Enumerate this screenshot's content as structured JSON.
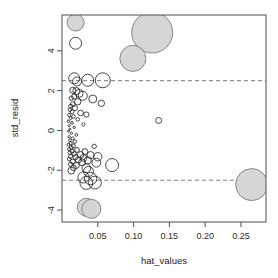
{
  "chart_data": {
    "type": "scatter",
    "title": "",
    "subtitle": "",
    "xlabel": "hat_values",
    "ylabel": "std_resid",
    "xlim": [
      0.0,
      0.285
    ],
    "ylim": [
      -4.6,
      5.8
    ],
    "xticks": [
      0.05,
      0.1,
      0.15,
      0.2,
      0.25
    ],
    "xtick_labels": [
      "0.05",
      "0.10",
      "0.15",
      "0.20",
      "0.25"
    ],
    "yticks": [
      4,
      2,
      0,
      -2,
      -4
    ],
    "ytick_labels": [
      "4",
      "2",
      "0",
      "-2",
      "-4"
    ],
    "grid": false,
    "legend": null,
    "annotations": [
      {
        "kind": "hline",
        "y": 2.5,
        "style": "dashed",
        "label": "+2.5 std_resid cutoff"
      },
      {
        "kind": "hline",
        "y": -2.5,
        "style": "dashed",
        "label": "-2.5 std_resid cutoff"
      }
    ],
    "marker_encoding": {
      "size_means": "cook_distance",
      "fill_means": "high_influence"
    },
    "colors": {
      "point_outline": "#1c1c1c",
      "point_fill_highlight": "#d4d4d4",
      "point_fill_highlight_stroke": "#7a7a7a",
      "axis": "#4d4d4d",
      "reference_line": "#6b6b6b",
      "background": "#ffffff"
    },
    "points": [
      {
        "x": 0.019,
        "y": 5.42,
        "r": 8.5,
        "filled": true
      },
      {
        "x": 0.019,
        "y": 4.38,
        "r": 6.0,
        "filled": false
      },
      {
        "x": 0.126,
        "y": 4.92,
        "r": 20.5,
        "filled": true
      },
      {
        "x": 0.099,
        "y": 3.62,
        "r": 13.0,
        "filled": true
      },
      {
        "x": 0.017,
        "y": 2.62,
        "r": 5.5,
        "filled": false
      },
      {
        "x": 0.021,
        "y": 2.46,
        "r": 4.5,
        "filled": false
      },
      {
        "x": 0.036,
        "y": 2.52,
        "r": 6.0,
        "filled": false
      },
      {
        "x": 0.057,
        "y": 2.52,
        "r": 7.5,
        "filled": false
      },
      {
        "x": 0.015,
        "y": 2.02,
        "r": 3.0,
        "filled": false
      },
      {
        "x": 0.02,
        "y": 1.98,
        "r": 3.5,
        "filled": false
      },
      {
        "x": 0.024,
        "y": 1.86,
        "r": 4.0,
        "filled": false
      },
      {
        "x": 0.029,
        "y": 1.74,
        "r": 4.5,
        "filled": false
      },
      {
        "x": 0.017,
        "y": 1.7,
        "r": 2.6,
        "filled": false
      },
      {
        "x": 0.013,
        "y": 1.62,
        "r": 2.2,
        "filled": false
      },
      {
        "x": 0.043,
        "y": 1.58,
        "r": 4.0,
        "filled": false
      },
      {
        "x": 0.055,
        "y": 1.36,
        "r": 3.2,
        "filled": false
      },
      {
        "x": 0.022,
        "y": 1.44,
        "r": 3.2,
        "filled": false
      },
      {
        "x": 0.015,
        "y": 1.32,
        "r": 2.4,
        "filled": false
      },
      {
        "x": 0.012,
        "y": 1.22,
        "r": 2.0,
        "filled": false
      },
      {
        "x": 0.018,
        "y": 1.12,
        "r": 2.6,
        "filled": false
      },
      {
        "x": 0.011,
        "y": 1.04,
        "r": 1.8,
        "filled": false
      },
      {
        "x": 0.014,
        "y": 0.94,
        "r": 2.0,
        "filled": false
      },
      {
        "x": 0.026,
        "y": 0.88,
        "r": 2.8,
        "filled": false
      },
      {
        "x": 0.034,
        "y": 0.8,
        "r": 2.6,
        "filled": false
      },
      {
        "x": 0.01,
        "y": 0.78,
        "r": 1.6,
        "filled": false
      },
      {
        "x": 0.016,
        "y": 0.7,
        "r": 1.8,
        "filled": false
      },
      {
        "x": 0.012,
        "y": 0.62,
        "r": 1.4,
        "filled": false
      },
      {
        "x": 0.022,
        "y": 0.56,
        "r": 1.8,
        "filled": false
      },
      {
        "x": 0.135,
        "y": 0.5,
        "r": 3.0,
        "filled": false
      },
      {
        "x": 0.009,
        "y": 0.46,
        "r": 1.2,
        "filled": false
      },
      {
        "x": 0.014,
        "y": 0.38,
        "r": 1.4,
        "filled": false
      },
      {
        "x": 0.03,
        "y": 0.3,
        "r": 1.6,
        "filled": false
      },
      {
        "x": 0.01,
        "y": 0.24,
        "r": 1.1,
        "filled": false
      },
      {
        "x": 0.017,
        "y": 0.16,
        "r": 1.2,
        "filled": false
      },
      {
        "x": 0.011,
        "y": 0.06,
        "r": 1.0,
        "filled": false
      },
      {
        "x": 0.009,
        "y": -0.04,
        "r": 1.0,
        "filled": false
      },
      {
        "x": 0.013,
        "y": -0.14,
        "r": 1.2,
        "filled": false
      },
      {
        "x": 0.02,
        "y": -0.22,
        "r": 1.4,
        "filled": false
      },
      {
        "x": 0.01,
        "y": -0.32,
        "r": 1.2,
        "filled": false
      },
      {
        "x": 0.015,
        "y": -0.4,
        "r": 1.5,
        "filled": false
      },
      {
        "x": 0.011,
        "y": -0.5,
        "r": 1.4,
        "filled": false
      },
      {
        "x": 0.018,
        "y": -0.56,
        "r": 1.8,
        "filled": false
      },
      {
        "x": 0.012,
        "y": -0.64,
        "r": 1.6,
        "filled": false
      },
      {
        "x": 0.009,
        "y": -0.72,
        "r": 1.4,
        "filled": false
      },
      {
        "x": 0.016,
        "y": -0.78,
        "r": 2.0,
        "filled": false
      },
      {
        "x": 0.013,
        "y": -0.86,
        "r": 1.8,
        "filled": false
      },
      {
        "x": 0.045,
        "y": -0.8,
        "r": 2.2,
        "filled": false
      },
      {
        "x": 0.01,
        "y": -0.94,
        "r": 1.6,
        "filled": false
      },
      {
        "x": 0.021,
        "y": -0.98,
        "r": 2.4,
        "filled": false
      },
      {
        "x": 0.014,
        "y": -1.04,
        "r": 2.0,
        "filled": false
      },
      {
        "x": 0.032,
        "y": -1.06,
        "r": 3.0,
        "filled": false
      },
      {
        "x": 0.011,
        "y": -1.12,
        "r": 1.8,
        "filled": false
      },
      {
        "x": 0.017,
        "y": -1.18,
        "r": 2.2,
        "filled": false
      },
      {
        "x": 0.026,
        "y": -1.22,
        "r": 3.2,
        "filled": false
      },
      {
        "x": 0.04,
        "y": -1.24,
        "r": 3.6,
        "filled": false
      },
      {
        "x": 0.012,
        "y": -1.3,
        "r": 2.0,
        "filled": false
      },
      {
        "x": 0.019,
        "y": -1.34,
        "r": 2.6,
        "filled": false
      },
      {
        "x": 0.03,
        "y": -1.38,
        "r": 3.4,
        "filled": false
      },
      {
        "x": 0.05,
        "y": -1.32,
        "r": 4.2,
        "filled": false
      },
      {
        "x": 0.01,
        "y": -1.44,
        "r": 1.8,
        "filled": false
      },
      {
        "x": 0.023,
        "y": -1.48,
        "r": 3.0,
        "filled": false
      },
      {
        "x": 0.036,
        "y": -1.5,
        "r": 3.6,
        "filled": false
      },
      {
        "x": 0.015,
        "y": -1.56,
        "r": 2.4,
        "filled": false
      },
      {
        "x": 0.028,
        "y": -1.6,
        "r": 3.4,
        "filled": false
      },
      {
        "x": 0.048,
        "y": -1.62,
        "r": 4.4,
        "filled": false
      },
      {
        "x": 0.012,
        "y": -1.7,
        "r": 2.2,
        "filled": false
      },
      {
        "x": 0.02,
        "y": -1.76,
        "r": 3.0,
        "filled": false
      },
      {
        "x": 0.07,
        "y": -1.74,
        "r": 6.5,
        "filled": false
      },
      {
        "x": 0.016,
        "y": -1.88,
        "r": 2.8,
        "filled": false
      },
      {
        "x": 0.034,
        "y": -1.9,
        "r": 4.4,
        "filled": false
      },
      {
        "x": 0.013,
        "y": -2.02,
        "r": 3.4,
        "filled": false
      },
      {
        "x": 0.037,
        "y": -2.06,
        "r": 5.0,
        "filled": false
      },
      {
        "x": 0.03,
        "y": -2.36,
        "r": 5.6,
        "filled": false
      },
      {
        "x": 0.04,
        "y": -2.42,
        "r": 6.2,
        "filled": false
      },
      {
        "x": 0.034,
        "y": -2.64,
        "r": 6.4,
        "filled": false
      },
      {
        "x": 0.046,
        "y": -2.62,
        "r": 6.4,
        "filled": false
      },
      {
        "x": 0.265,
        "y": -2.72,
        "r": 16.0,
        "filled": true
      },
      {
        "x": 0.034,
        "y": -3.86,
        "r": 9.0,
        "filled": true
      },
      {
        "x": 0.041,
        "y": -3.94,
        "r": 9.5,
        "filled": true
      }
    ]
  }
}
